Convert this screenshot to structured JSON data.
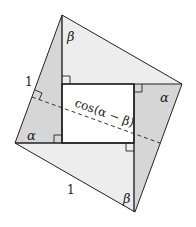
{
  "diagram": {
    "colors": {
      "light_fill": "#ededed",
      "dark_fill": "#d6d6d6",
      "inner_fill": "#ffffff",
      "stroke": "#222222"
    },
    "vertices": {
      "top": [
        62,
        15
      ],
      "right": [
        182,
        84
      ],
      "bottom": [
        135,
        212
      ],
      "left": [
        15,
        143
      ]
    },
    "inner_rect": {
      "x1": 62,
      "y1": 84,
      "x2": 134,
      "y2": 143
    },
    "labels": {
      "beta_top": "β",
      "alpha_right": "α",
      "alpha_left": "α",
      "beta_bottom": "β",
      "side_left": "1",
      "side_bottom": "1",
      "dashed": "cos(α − β)"
    },
    "dashed_line": {
      "x1": 32,
      "y1": 97,
      "x2": 160,
      "y2": 143
    }
  }
}
